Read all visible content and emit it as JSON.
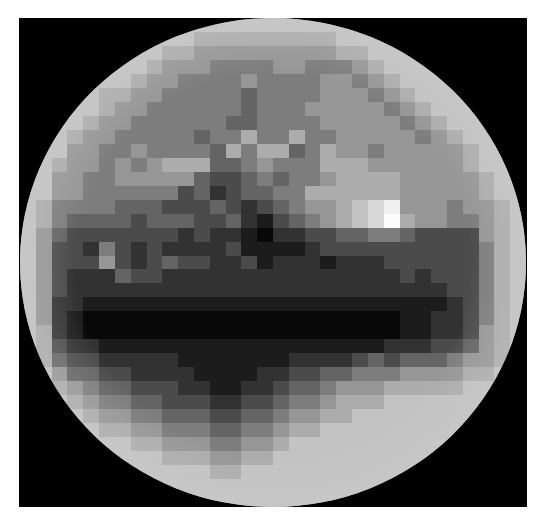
{
  "image": {
    "subject": "pixelated grayscale sphere",
    "background_color": "#000000",
    "canvas_color": "#ffffff",
    "limb_color": "#d8d8d8"
  },
  "image_data": {
    "cols": 32,
    "rows": 35,
    "palette": {
      "0": 8,
      "1": 28,
      "2": 50,
      "3": 75,
      "4": 100,
      "5": 125,
      "6": 150,
      "7": 172,
      "8": 195,
      "9": 215,
      "A": 240,
      "B": 252
    },
    "tiles": [
      "88888888888888888888888888888888",
      "88888888888777777777888888888888",
      "88888888877666666666778888888888",
      "88888888766655556655567888888888",
      "88888887665555655556656788888888",
      "88888776655555455556665678888888",
      "88888766555555455566666567888888",
      "88887665555554455556666656788888",
      "88876655555455755755666665678888",
      "88866556555547577457665666667888",
      "88766565677744565557776666667888",
      "88665566666433454556777766666788",
      "88665555553423445577777766666788",
      "87555544433343234566789A66656678",
      "87544443444334213456789B76655678",
      "86433333332322102233445543333678",
      "86332532322223111123333333333578",
      "86333632343322312221222333333578",
      "86322243322222222222222232333578",
      "86322222222222222222222222233578",
      "86221111111111111111111111123578",
      "86210000000000000000000011223578",
      "87210000000000000000000011223678",
      "87322111111111111111111222334678",
      "87433222221111111222234344456678",
      "88644332222111122334455566667788",
      "88765443332211223445666777778888",
      "88876554433322334556777888888888",
      "88887665544433445667788888888888",
      "88888776655544556778888888888888",
      "88888887766655667888888888888888",
      "88888888877766778888888888888888",
      "88888888888877888888888888888888",
      "88888888888888888888888888888888",
      "88888888888888888888888888888888"
    ]
  }
}
